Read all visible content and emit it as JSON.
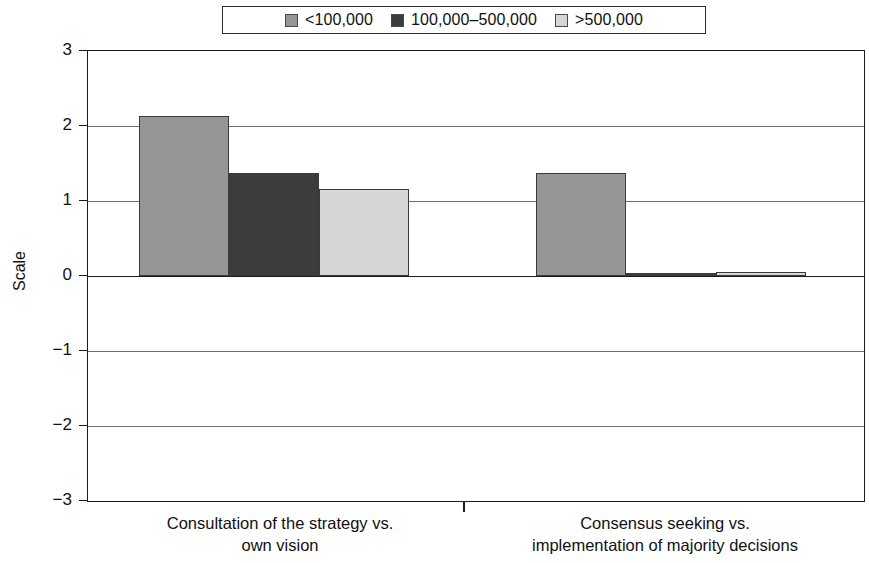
{
  "chart_data": {
    "type": "bar",
    "title": "",
    "xlabel": "",
    "ylabel": "Scale",
    "ylim": [
      -3,
      3
    ],
    "ytick_labels": [
      "3",
      "2",
      "1",
      "0",
      "−1",
      "−2",
      "−3"
    ],
    "ytick_values": [
      3,
      2,
      1,
      0,
      -1,
      -2,
      -3
    ],
    "grid": true,
    "legend_position": "top-center",
    "categories": [
      "Consultation of the strategy vs. own vision",
      "Consensus seeking vs. implementation of majority decisions"
    ],
    "category_lines": [
      [
        "Consultation of the strategy vs.",
        "own vision"
      ],
      [
        "Consensus seeking vs.",
        "implementation of majority decisions"
      ]
    ],
    "series": [
      {
        "name": "<100,000",
        "color": "#969696",
        "values": [
          2.13,
          1.38
        ]
      },
      {
        "name": "100,000–500,000",
        "color": "#3c3c3c",
        "values": [
          1.38,
          0.02
        ]
      },
      {
        "name": ">500,000",
        "color": "#d6d6d6",
        "values": [
          1.16,
          0.06
        ]
      }
    ]
  },
  "legend": {
    "entries": [
      {
        "label": "<100,000",
        "color": "#969696"
      },
      {
        "label": "100,000–500,000",
        "color": "#3c3c3c"
      },
      {
        "label": ">500,000",
        "color": "#d6d6d6"
      }
    ]
  },
  "axis": {
    "y_label": "Scale",
    "y_ticks": [
      "3",
      "2",
      "1",
      "0",
      "−1",
      "−2",
      "−3"
    ]
  }
}
